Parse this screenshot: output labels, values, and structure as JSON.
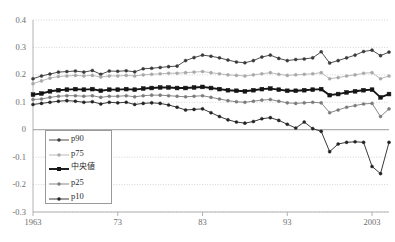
{
  "chart_data": {
    "type": "line",
    "title": "",
    "xlabel": "",
    "ylabel": "",
    "xlim": [
      1963,
      2005
    ],
    "ylim": [
      -0.3,
      0.4
    ],
    "ytick_labels": [
      "0.4",
      "0.3",
      "0.2",
      "0.1",
      "0",
      "-0.1",
      "-0.2",
      "-0.3"
    ],
    "ytick_values": [
      0.4,
      0.3,
      0.2,
      0.1,
      0,
      -0.1,
      -0.2,
      -0.3
    ],
    "xtick_labels": [
      "1963",
      "73",
      "83",
      "93",
      "2003"
    ],
    "xtick_values": [
      1963,
      1973,
      1983,
      1993,
      2003
    ],
    "grid": "dotted-horizontal",
    "zero_line": true,
    "legend_position": "lower-left",
    "x": [
      1963,
      1964,
      1965,
      1966,
      1967,
      1968,
      1969,
      1970,
      1971,
      1972,
      1973,
      1974,
      1975,
      1976,
      1977,
      1978,
      1979,
      1980,
      1981,
      1982,
      1983,
      1984,
      1985,
      1986,
      1987,
      1988,
      1989,
      1990,
      1991,
      1992,
      1993,
      1994,
      1995,
      1996,
      1997,
      1998,
      1999,
      2000,
      2001,
      2002,
      2003,
      2004,
      2005
    ],
    "series": [
      {
        "name": "p90",
        "color": "#3a3a3a",
        "marker": "circle",
        "width": 0.9,
        "values": [
          0.186,
          0.196,
          0.203,
          0.21,
          0.212,
          0.214,
          0.21,
          0.216,
          0.202,
          0.214,
          0.213,
          0.215,
          0.211,
          0.222,
          0.224,
          0.227,
          0.23,
          0.232,
          0.252,
          0.263,
          0.272,
          0.268,
          0.262,
          0.254,
          0.247,
          0.244,
          0.252,
          0.265,
          0.272,
          0.26,
          0.252,
          0.256,
          0.258,
          0.262,
          0.284,
          0.243,
          0.252,
          0.262,
          0.272,
          0.285,
          0.29,
          0.27,
          0.283
        ]
      },
      {
        "name": "p75",
        "color": "#a8a8a8",
        "marker": "circle",
        "width": 0.8,
        "values": [
          0.168,
          0.178,
          0.188,
          0.194,
          0.196,
          0.198,
          0.196,
          0.198,
          0.192,
          0.196,
          0.196,
          0.198,
          0.196,
          0.2,
          0.202,
          0.204,
          0.206,
          0.206,
          0.208,
          0.21,
          0.212,
          0.208,
          0.204,
          0.2,
          0.198,
          0.196,
          0.2,
          0.204,
          0.208,
          0.202,
          0.198,
          0.2,
          0.202,
          0.204,
          0.208,
          0.186,
          0.19,
          0.196,
          0.2,
          0.206,
          0.208,
          0.186,
          0.196
        ]
      },
      {
        "name": "中央値",
        "color": "#151515",
        "marker": "square",
        "width": 1.9,
        "values": [
          0.128,
          0.132,
          0.14,
          0.144,
          0.146,
          0.148,
          0.146,
          0.148,
          0.142,
          0.146,
          0.146,
          0.148,
          0.146,
          0.15,
          0.152,
          0.154,
          0.154,
          0.152,
          0.152,
          0.154,
          0.156,
          0.152,
          0.148,
          0.144,
          0.142,
          0.14,
          0.144,
          0.148,
          0.15,
          0.146,
          0.142,
          0.142,
          0.144,
          0.146,
          0.148,
          0.126,
          0.13,
          0.136,
          0.14,
          0.144,
          0.146,
          0.118,
          0.13
        ]
      },
      {
        "name": "p25",
        "color": "#7b7b7b",
        "marker": "circle",
        "width": 0.9,
        "values": [
          0.11,
          0.112,
          0.118,
          0.122,
          0.124,
          0.124,
          0.122,
          0.124,
          0.118,
          0.122,
          0.122,
          0.124,
          0.12,
          0.124,
          0.126,
          0.126,
          0.124,
          0.122,
          0.12,
          0.122,
          0.124,
          0.118,
          0.112,
          0.106,
          0.102,
          0.1,
          0.104,
          0.108,
          0.11,
          0.104,
          0.098,
          0.096,
          0.098,
          0.1,
          0.098,
          0.062,
          0.072,
          0.082,
          0.088,
          0.094,
          0.096,
          0.048,
          0.076
        ]
      },
      {
        "name": "p10",
        "color": "#242424",
        "marker": "circle",
        "width": 0.9,
        "values": [
          0.092,
          0.096,
          0.1,
          0.104,
          0.106,
          0.104,
          0.1,
          0.102,
          0.094,
          0.1,
          0.098,
          0.1,
          0.092,
          0.096,
          0.098,
          0.096,
          0.09,
          0.082,
          0.072,
          0.074,
          0.076,
          0.062,
          0.048,
          0.036,
          0.028,
          0.024,
          0.03,
          0.04,
          0.044,
          0.034,
          0.02,
          0.006,
          0.028,
          0.004,
          -0.006,
          -0.08,
          -0.052,
          -0.046,
          -0.044,
          -0.046,
          -0.134,
          -0.16,
          -0.046
        ]
      }
    ]
  },
  "legend": {
    "items": [
      {
        "label": "p90"
      },
      {
        "label": "p75"
      },
      {
        "label": "中央値"
      },
      {
        "label": "p25"
      },
      {
        "label": "p10"
      }
    ]
  }
}
